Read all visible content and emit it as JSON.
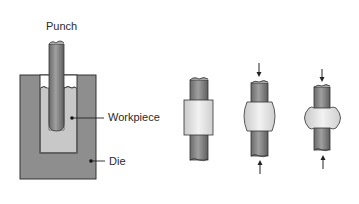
{
  "diagram": {
    "left": {
      "labels": {
        "punch": "Punch",
        "workpiece": "Workpiece",
        "die": "Die"
      }
    },
    "right": {
      "stages": [
        {
          "name": "initial",
          "has_arrows": false
        },
        {
          "name": "compressed",
          "has_arrows": true
        },
        {
          "name": "fully-compressed",
          "has_arrows": true
        }
      ]
    },
    "colors": {
      "die": "#8e8e8e",
      "workpiece": "#c8c8c8",
      "punch": "#7f7f7f",
      "rod": "#828282",
      "collar": "#e6e6e6",
      "outline": "#333333"
    }
  }
}
